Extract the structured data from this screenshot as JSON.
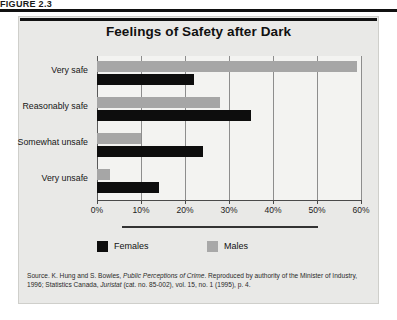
{
  "figure": {
    "label": "FIGURE 2.3"
  },
  "chart_data": {
    "type": "bar",
    "orientation": "horizontal",
    "title": "Feelings of Safety after Dark",
    "categories": [
      "Very safe",
      "Reasonably safe",
      "Somewhat unsafe",
      "Very unsafe"
    ],
    "series": [
      {
        "name": "Females",
        "color": "#0d0d0d",
        "values": [
          22,
          35,
          24,
          14
        ]
      },
      {
        "name": "Males",
        "color": "#a6a6a6",
        "values": [
          59,
          28,
          10,
          3
        ]
      }
    ],
    "xlabel": "",
    "ylabel": "",
    "xlim": [
      0,
      60
    ],
    "xticks": [
      0,
      10,
      20,
      30,
      40,
      50,
      60
    ],
    "xticklabels": [
      "0%",
      "10%",
      "20%",
      "30%",
      "40%",
      "50%",
      "60%"
    ],
    "grid": true,
    "legend_position": "bottom"
  },
  "legend": {
    "items": [
      {
        "label": "Females",
        "swatch": "females"
      },
      {
        "label": "Males",
        "swatch": "males"
      }
    ]
  },
  "source": {
    "prefix": "Source. K. Hung and S. Bowles, ",
    "title1": "Public Perceptions of Crime",
    "middle": ". Reproduced by authority of the Minister of Industry, 1996; Statistics Canada, ",
    "title2": "Juristat",
    "suffix": " (cat. no. 85-002), vol. 15, no. 1 (1995), p. 4."
  }
}
